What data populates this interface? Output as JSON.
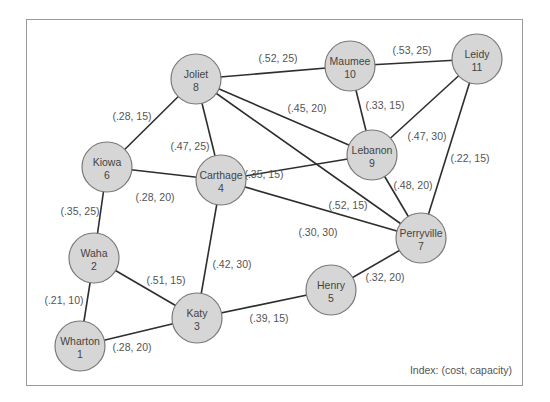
{
  "diagram": {
    "type": "network-graph",
    "legend": "Index: (cost, capacity)",
    "colors": {
      "node_fill": "#d6d6d6",
      "node_stroke": "#7a7a7a",
      "edge": "#2e2e2e",
      "frame": "#9a9a9a",
      "text": "#444444"
    },
    "nodes": [
      {
        "id": 1,
        "name": "Wharton",
        "number": "1",
        "x": 80,
        "y": 346
      },
      {
        "id": 2,
        "name": "Waha",
        "number": "2",
        "x": 94,
        "y": 258
      },
      {
        "id": 3,
        "name": "Katy",
        "number": "3",
        "x": 197,
        "y": 318
      },
      {
        "id": 4,
        "name": "Carthage",
        "number": "4",
        "x": 221,
        "y": 180
      },
      {
        "id": 5,
        "name": "Henry",
        "number": "5",
        "x": 331,
        "y": 290
      },
      {
        "id": 6,
        "name": "Kiowa",
        "number": "6",
        "x": 107,
        "y": 167
      },
      {
        "id": 7,
        "name": "Perryville",
        "number": "7",
        "x": 421,
        "y": 238
      },
      {
        "id": 8,
        "name": "Joliet",
        "number": "8",
        "x": 196,
        "y": 79
      },
      {
        "id": 9,
        "name": "Lebanon",
        "number": "9",
        "x": 372,
        "y": 155
      },
      {
        "id": 10,
        "name": "Maumee",
        "number": "10",
        "x": 350,
        "y": 66
      },
      {
        "id": 11,
        "name": "Leidy",
        "number": "11",
        "x": 477,
        "y": 59
      }
    ],
    "edges": [
      {
        "from": 8,
        "to": 10,
        "label": "(.52, 25)",
        "lx": 278,
        "ly": 62
      },
      {
        "from": 10,
        "to": 11,
        "label": "(.53, 25)",
        "lx": 412,
        "ly": 54
      },
      {
        "from": 8,
        "to": 6,
        "label": "(.28, 15)",
        "lx": 132,
        "ly": 120
      },
      {
        "from": 8,
        "to": 4,
        "label": "(.47, 25)",
        "lx": 190,
        "ly": 150
      },
      {
        "from": 8,
        "to": 9,
        "label": "(.45, 20)",
        "lx": 307,
        "ly": 112
      },
      {
        "from": 8,
        "to": 7,
        "label": "(.52, 15)",
        "lx": 348,
        "ly": 209
      },
      {
        "from": 10,
        "to": 9,
        "label": "(.33, 15)",
        "lx": 385,
        "ly": 109
      },
      {
        "from": 11,
        "to": 9,
        "label": "(.47, 30)",
        "lx": 427,
        "ly": 140
      },
      {
        "from": 11,
        "to": 7,
        "label": "(.22, 15)",
        "lx": 470,
        "ly": 162
      },
      {
        "from": 9,
        "to": 7,
        "label": "(.48, 20)",
        "lx": 413,
        "ly": 189
      },
      {
        "from": 6,
        "to": 4,
        "label": "(.28, 20)",
        "lx": 155,
        "ly": 201
      },
      {
        "from": 4,
        "to": 9,
        "label": "(.35, 15)",
        "lx": 264,
        "ly": 178
      },
      {
        "from": 4,
        "to": 7,
        "label": "(.30, 30)",
        "lx": 318,
        "ly": 236
      },
      {
        "from": 6,
        "to": 2,
        "label": "(.35, 25)",
        "lx": 80,
        "ly": 215
      },
      {
        "from": 4,
        "to": 3,
        "label": "(.42, 30)",
        "lx": 232,
        "ly": 268
      },
      {
        "from": 2,
        "to": 3,
        "label": "(.51, 15)",
        "lx": 166,
        "ly": 284
      },
      {
        "from": 2,
        "to": 1,
        "label": "(.21, 10)",
        "lx": 64,
        "ly": 304
      },
      {
        "from": 1,
        "to": 3,
        "label": "(.28, 20)",
        "lx": 132,
        "ly": 351
      },
      {
        "from": 3,
        "to": 5,
        "label": "(.39, 15)",
        "lx": 269,
        "ly": 322
      },
      {
        "from": 5,
        "to": 7,
        "label": "(.32, 20)",
        "lx": 385,
        "ly": 281
      }
    ]
  }
}
